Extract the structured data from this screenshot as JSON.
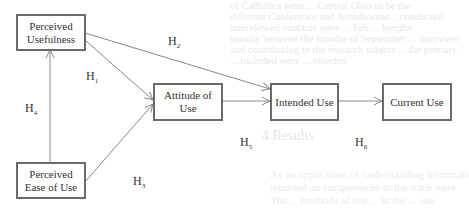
{
  "diagram": {
    "type": "flowchart",
    "nodes": [
      {
        "id": "pu",
        "label": "Perceived Usefulness"
      },
      {
        "id": "au",
        "label": "Attitude of Use"
      },
      {
        "id": "iu",
        "label": "Intended Use"
      },
      {
        "id": "cu",
        "label": "Current Use"
      },
      {
        "id": "peou",
        "label": "Perceived Ease of Use"
      }
    ],
    "edges": [
      {
        "from": "pu",
        "to": "au",
        "label": "H1"
      },
      {
        "from": "pu",
        "to": "iu",
        "label": "H2"
      },
      {
        "from": "peou",
        "to": "au",
        "label": "H3"
      },
      {
        "from": "peou",
        "to": "pu",
        "label": "H4"
      },
      {
        "from": "au",
        "to": "iu",
        "label": "H5"
      },
      {
        "from": "iu",
        "to": "cu",
        "label": "H6"
      }
    ],
    "labels": {
      "h1": {
        "base": "H",
        "sub": "1"
      },
      "h2": {
        "base": "H",
        "sub": "2"
      },
      "h3": {
        "base": "H",
        "sub": "3"
      },
      "h4": {
        "base": "H",
        "sub": "4"
      },
      "h5": {
        "base": "H",
        "sub": "5"
      },
      "h6": {
        "base": "H",
        "sub": "6"
      }
    },
    "node_text": {
      "pu_line1": "Perceived",
      "pu_line2": "Usefulness",
      "au_line1": "Attitude of",
      "au_line2": "Use",
      "iu": "Intended Use",
      "cu": "Current Use",
      "peou_line1": "Perceived",
      "peou_line2": "Ease of Use"
    }
  },
  "background": {
    "faint_lines_top": [
      "of Catholics were ... Central Ohio to be the",
      "different Conference and Archdiocese... conducted",
      "interviewed contacts were ... Feb ... lengthy",
      "usually between the months of September ... interview",
      "and contributing to the research subject ... the primary",
      "... included were ... selected"
    ],
    "faint_heading": "4  Results",
    "faint_lines_bottom": [
      "As an application of understanding information",
      "reported on competences to the trade were",
      "The ... methods of use ... in the ... use"
    ]
  }
}
